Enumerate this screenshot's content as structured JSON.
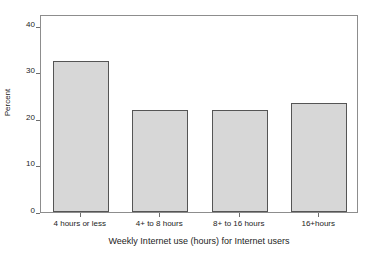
{
  "figure": {
    "clipped_header_text": "",
    "background_color": "#ffffff"
  },
  "chart_data": {
    "type": "bar",
    "title": "",
    "subtitle": "",
    "xlabel": "Weekly Internet use (hours) for Internet users",
    "ylabel": "Percent",
    "categories": [
      "4 hours or less",
      "4+ to 8 hours",
      "8+ to 16 hours",
      "16+hours"
    ],
    "values": [
      32.5,
      22.0,
      22.0,
      23.3
    ],
    "ylim": [
      0,
      42.5
    ],
    "yticks": [
      0,
      10,
      20,
      30,
      40
    ],
    "ytick_labels": [
      "0",
      "10",
      "20",
      "30",
      "40"
    ],
    "grid": false,
    "legend": null,
    "bar_fill_color": "#d7d7d7",
    "bar_edge_color": "#555555",
    "axis_color": "#8d8d8d"
  }
}
